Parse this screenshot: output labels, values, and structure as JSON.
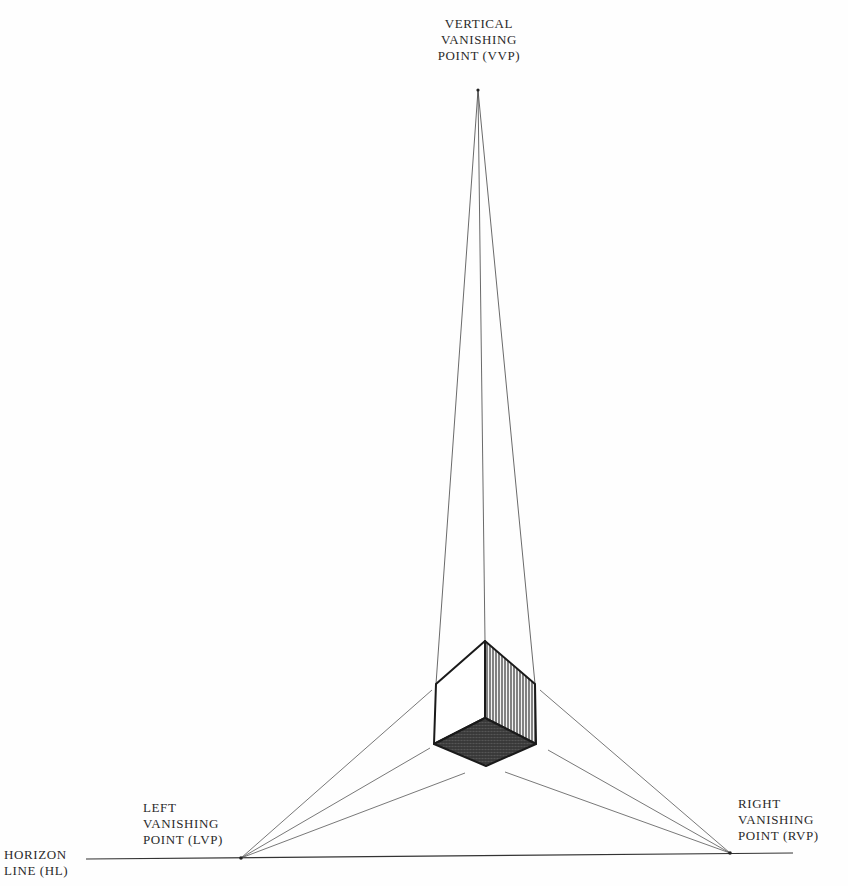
{
  "diagram": {
    "labels": {
      "vvp": [
        "VERTICAL",
        "VANISHING",
        "POINT (VVP)"
      ],
      "lvp": [
        "LEFT",
        "VANISHING",
        "POINT (LVP)"
      ],
      "rvp": [
        "RIGHT",
        "VANISHING",
        "POINT (RVP)"
      ],
      "hl": [
        "HORIZON",
        "LINE (HL)"
      ]
    },
    "points": {
      "VVP": [
        478,
        90
      ],
      "LVP": [
        241,
        858
      ],
      "RVP": [
        730,
        853
      ]
    },
    "colors": {
      "line": "#3a3a3a",
      "edge": "#1a1a1a",
      "background": "#fefefe"
    }
  }
}
